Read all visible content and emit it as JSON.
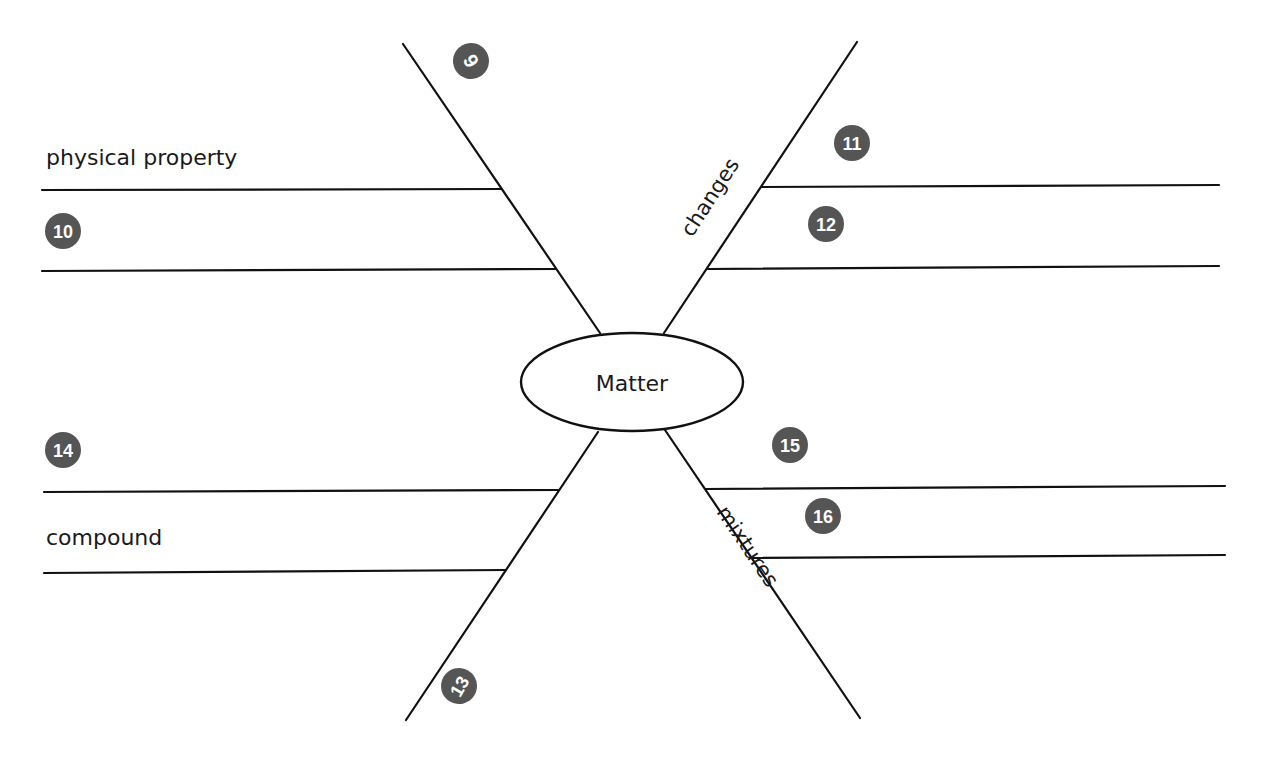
{
  "diagram": {
    "type": "spider-map",
    "center": {
      "label": "Matter"
    },
    "legs": [
      {
        "position": "top-left",
        "leg_label": "",
        "leg_badge": "6",
        "lines": [
          {
            "label": "physical property",
            "badge": ""
          },
          {
            "label": "",
            "badge": "10"
          }
        ]
      },
      {
        "position": "top-right",
        "leg_label": "changes",
        "leg_badge": "",
        "lines": [
          {
            "label": "",
            "badge": "11"
          },
          {
            "label": "",
            "badge": "12"
          }
        ]
      },
      {
        "position": "bottom-left",
        "leg_label": "",
        "leg_badge": "13",
        "lines": [
          {
            "label": "",
            "badge": "14"
          },
          {
            "label": "compound",
            "badge": ""
          }
        ]
      },
      {
        "position": "bottom-right",
        "leg_label": "mixtures",
        "leg_badge": "",
        "lines": [
          {
            "label": "",
            "badge": "15"
          },
          {
            "label": "",
            "badge": "16"
          }
        ]
      }
    ]
  },
  "colors": {
    "line": "#111111",
    "badge_fill": "#555555",
    "badge_text": "#ffffff",
    "text": "#1a1a1a"
  }
}
